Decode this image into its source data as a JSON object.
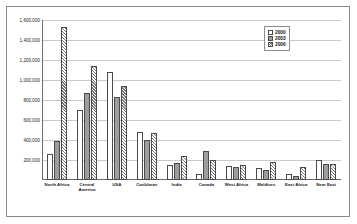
{
  "chart_data": {
    "type": "bar",
    "title": "",
    "subtitle": "",
    "xlabel": "",
    "ylabel": "",
    "ylim": [
      0,
      1600000
    ],
    "grid": true,
    "legend_position": "top-right",
    "ytick_labels": [
      "1,600,000",
      "1,400,000",
      "1,200,000",
      "1,000,000",
      "800,000",
      "600,000",
      "400,000",
      "200,000"
    ],
    "ytick_values": [
      1600000,
      1400000,
      1200000,
      1000000,
      800000,
      600000,
      400000,
      200000
    ],
    "categories": [
      "North Africa",
      "Central\nAmerica",
      "USA",
      "Caribbean",
      "India",
      "Canada",
      "West Africa",
      "Maldives",
      "East Africa",
      "Near East"
    ],
    "series": [
      {
        "name": "2000",
        "values": [
          260000,
          700000,
          1080000,
          480000,
          150000,
          60000,
          140000,
          120000,
          60000,
          200000
        ]
      },
      {
        "name": "2003",
        "values": [
          390000,
          870000,
          830000,
          400000,
          175000,
          290000,
          135000,
          100000,
          40000,
          160000
        ]
      },
      {
        "name": "2006",
        "values": [
          1530000,
          1140000,
          940000,
          470000,
          240000,
          200000,
          150000,
          185000,
          130000,
          160000
        ]
      }
    ]
  },
  "legend": {
    "items": [
      {
        "label": "2000",
        "swatch": "legend-swatch-white"
      },
      {
        "label": "2003",
        "swatch": "legend-swatch-gray"
      },
      {
        "label": "2006",
        "swatch": "legend-swatch-hatched"
      }
    ]
  }
}
